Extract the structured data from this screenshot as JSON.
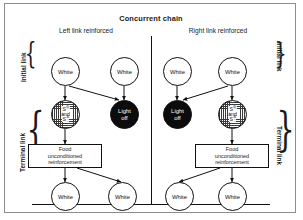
{
  "figure": {
    "title": "Concurrent chain",
    "panels": [
      {
        "id": "left",
        "title": "Left link reinforced"
      },
      {
        "id": "right",
        "title": "Right link reinforced"
      }
    ],
    "side_labels": {
      "initial": "Initial link",
      "terminal": "Terminal link"
    },
    "nodes": {
      "white": "White",
      "light_off_line1": "Light",
      "light_off_line2": "off",
      "sd": "S",
      "sd_sup": "D",
      "and": "and",
      "sdelta": "S",
      "sdelta_sup": "Δ",
      "food_line1": "Food",
      "food_line2": "unconditioned",
      "food_line3": "reinforcement"
    }
  }
}
